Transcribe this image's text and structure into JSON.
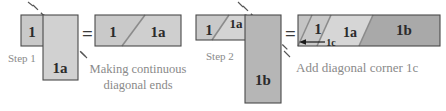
{
  "figure": {
    "background_color": "#ffffff"
  },
  "colors": {
    "fabric_light": "#d6d6d6",
    "fabric_mid": "#c9c9c9",
    "fabric_dark": "#a9a9a9",
    "outline": "#4a4a4a",
    "label_text": "#2b2b2b",
    "caption_text": "#8a8a8a",
    "dash_line": "#555555",
    "equals": "#3a3a3a"
  },
  "groups": [
    {
      "id": "step-1-overlap",
      "step_label": "Step 1",
      "pieces": [
        {
          "name": "piece-1",
          "label": "1"
        },
        {
          "name": "piece-1a",
          "label": "1a"
        }
      ],
      "guide": {
        "name": "diagonal-dash-guide",
        "style": "dashed"
      }
    },
    {
      "id": "step-1-result",
      "operator": "=",
      "caption_line_1": "Making continuous",
      "caption_line_2": "diagonal ends",
      "pieces": [
        {
          "name": "piece-1",
          "label": "1"
        },
        {
          "name": "piece-1a",
          "label": "1a"
        }
      ]
    },
    {
      "id": "step-2-overlap",
      "step_label": "Step 2",
      "pieces": [
        {
          "name": "piece-1",
          "label": "1"
        },
        {
          "name": "piece-1a",
          "label": "1a"
        },
        {
          "name": "piece-1b",
          "label": "1b"
        }
      ],
      "guide": {
        "name": "diagonal-dash-guide",
        "style": "dashed"
      }
    },
    {
      "id": "step-2-result",
      "operator": "=",
      "caption": "Add diagonal corner 1c",
      "pieces": [
        {
          "name": "piece-1",
          "label": "1"
        },
        {
          "name": "piece-1a",
          "label": "1a"
        },
        {
          "name": "piece-1b",
          "label": "1b"
        }
      ],
      "annotation": {
        "name": "corner-1c-callout",
        "label": "1c",
        "arrow": "left"
      }
    }
  ],
  "operators": {
    "equals_1": "=",
    "equals_2": "="
  }
}
